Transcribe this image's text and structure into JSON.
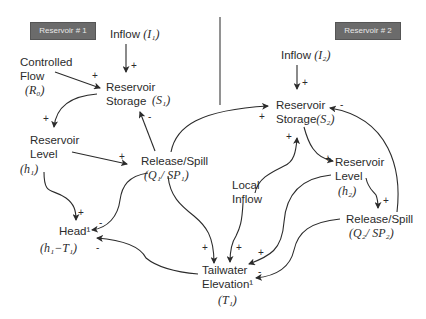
{
  "tags": {
    "reservoir1": "Reservoir # 1",
    "reservoir2": "Reservoir # 2"
  },
  "nodes": {
    "inflow1": {
      "label": "Inflow",
      "symbol": "(I₁)"
    },
    "controlled_flow": {
      "line1": "Controlled",
      "line2": "Flow",
      "symbol": "(R₀)"
    },
    "storage1": {
      "line1": "Reservoir",
      "line2": "Storage",
      "symbol": "(S₁)"
    },
    "level1": {
      "line1": "Reservoir",
      "line2": "Level",
      "symbol": "(h₁)"
    },
    "release1": {
      "line1": "Release/Spill",
      "symbol": "(Q₁/ SP₁)"
    },
    "head": {
      "line1": "Head¹",
      "symbol": "(h₁−T₁)"
    },
    "local_inflow": {
      "line1": "Local",
      "line2": "Inflow"
    },
    "tailwater": {
      "line1": "Tailwater",
      "line2": "Elevation¹",
      "symbol": "(T₁)"
    },
    "inflow2": {
      "label": "Inflow",
      "symbol": "(I₂)"
    },
    "storage2": {
      "line1": "Reservoir",
      "line2": "Storage",
      "symbol": "(S₂)"
    },
    "level2": {
      "line1": "Reservoir",
      "line2": "Level",
      "symbol": "(h₂)"
    },
    "release2": {
      "line1": "Release/Spill",
      "symbol": "(Q₂/ SP₂)"
    }
  },
  "links": [
    {
      "from": "inflow1",
      "to": "storage1",
      "sign": "+"
    },
    {
      "from": "controlled_flow",
      "to": "storage1",
      "sign": "+"
    },
    {
      "from": "storage1",
      "to": "level1",
      "sign": "+"
    },
    {
      "from": "release1",
      "to": "storage1",
      "sign": "-"
    },
    {
      "from": "level1",
      "to": "release1",
      "sign": "+"
    },
    {
      "from": "level1",
      "to": "head",
      "sign": "+"
    },
    {
      "from": "release1",
      "to": "head",
      "sign": "-"
    },
    {
      "from": "tailwater",
      "to": "head",
      "sign": "-"
    },
    {
      "from": "release1",
      "to": "storage2",
      "sign": "+"
    },
    {
      "from": "release1",
      "to": "tailwater",
      "sign": "+"
    },
    {
      "from": "local_inflow",
      "to": "storage2",
      "sign": "+"
    },
    {
      "from": "local_inflow",
      "to": "tailwater",
      "sign": "+"
    },
    {
      "from": "inflow2",
      "to": "storage2",
      "sign": "+"
    },
    {
      "from": "storage2",
      "to": "level2",
      "sign": "+"
    },
    {
      "from": "level2",
      "to": "release2",
      "sign": "+"
    },
    {
      "from": "release2",
      "to": "storage2",
      "sign": "-"
    },
    {
      "from": "level2",
      "to": "tailwater",
      "sign": "+"
    },
    {
      "from": "release2",
      "to": "tailwater",
      "sign": "-"
    }
  ],
  "signs": {
    "plus": "+",
    "minus": "-"
  },
  "colors": {
    "tag_bg": "#6b6b6b",
    "tag_text": "#e8e8e8",
    "line": "#2b2b2b",
    "divider": "#777777"
  }
}
